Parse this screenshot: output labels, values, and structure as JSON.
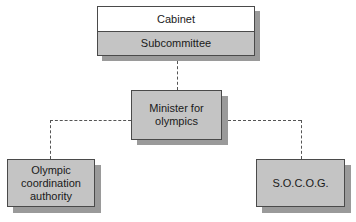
{
  "diagram": {
    "type": "org-chart",
    "nodes": [
      {
        "id": "cabinet",
        "label": "Cabinet",
        "sublabel": "Subcommittee"
      },
      {
        "id": "minister",
        "label": "Minister for olympics"
      },
      {
        "id": "oca",
        "label": "Olympic coordination authority"
      },
      {
        "id": "socog",
        "label": "S.O.C.O.G."
      }
    ],
    "edges": [
      {
        "from": "cabinet",
        "to": "minister",
        "style": "dashed"
      },
      {
        "from": "minister",
        "to": "oca",
        "style": "dashed"
      },
      {
        "from": "minister",
        "to": "socog",
        "style": "dashed"
      }
    ]
  },
  "labels": {
    "cabinet": "Cabinet",
    "subcommittee": "Subcommittee",
    "minister_line1": "Minister for",
    "minister_line2": "olympics",
    "oca_line1": "Olympic",
    "oca_line2": "coordination",
    "oca_line3": "authority",
    "socog": "S.O.C.O.G."
  },
  "colors": {
    "box_fill": "#c4c4c4",
    "shadow": "#9a9a9a",
    "border": "#4a4a4a"
  }
}
